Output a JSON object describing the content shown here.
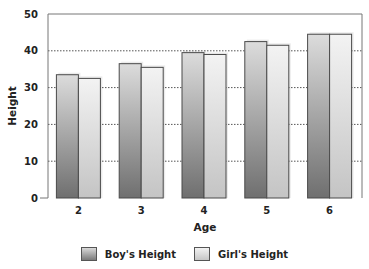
{
  "chart_data": {
    "type": "bar",
    "title": "",
    "xlabel": "Age",
    "ylabel": "Height",
    "categories": [
      "2",
      "3",
      "4",
      "5",
      "6"
    ],
    "series": [
      {
        "name": "Boy's Height",
        "values": [
          33.5,
          36.5,
          39.5,
          42.5,
          44.5
        ],
        "color": "#8a8a8a"
      },
      {
        "name": "Girl's Height",
        "values": [
          32.5,
          35.5,
          39,
          41.5,
          44.5
        ],
        "color": "#d4d4d4"
      }
    ],
    "ylim": [
      0,
      50
    ],
    "yticks": [
      0,
      10,
      20,
      30,
      40,
      50
    ],
    "grid": {
      "y": true,
      "style": "dotted"
    },
    "legend_position": "bottom"
  },
  "legend": {
    "boy_label": "Boy's Height",
    "girl_label": "Girl's Height"
  }
}
